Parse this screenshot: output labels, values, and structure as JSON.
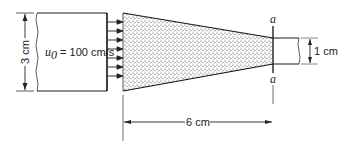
{
  "diagram": {
    "inlet_velocity_label": "u",
    "inlet_velocity_subscript": "0",
    "inlet_velocity_value": " = 100 cm/s",
    "inlet_height_label": "3 cm",
    "outlet_height_label": "1 cm",
    "length_label": "6 cm",
    "section_label_top": "a",
    "section_label_bottom": "a",
    "colors": {
      "line": "#1a1a1a",
      "stipple": "#555555"
    }
  }
}
